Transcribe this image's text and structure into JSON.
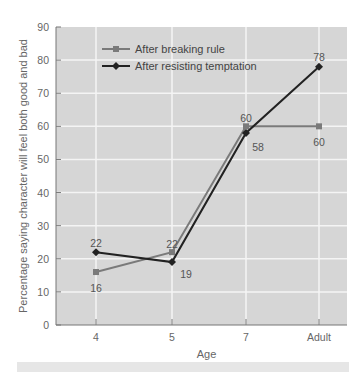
{
  "chart_data": {
    "type": "line",
    "title": "",
    "xlabel": "Age",
    "ylabel": "Percentage saying character will feel both good and bad",
    "categories": [
      "4",
      "5",
      "7",
      "Adult"
    ],
    "ylim": [
      0,
      90
    ],
    "yticks": [
      0,
      10,
      20,
      30,
      40,
      50,
      60,
      70,
      80,
      90
    ],
    "grid": true,
    "legend_position": "upper-left",
    "series": [
      {
        "name": "After breaking rule",
        "values": [
          16,
          22,
          60,
          60
        ],
        "color": "#7a7a7a",
        "marker": "square"
      },
      {
        "name": "After resisting temptation",
        "values": [
          22,
          19,
          58,
          78
        ],
        "color": "#222222",
        "marker": "diamond"
      }
    ],
    "data_labels": [
      {
        "series": 0,
        "index": 0,
        "text": "16"
      },
      {
        "series": 0,
        "index": 1,
        "text": "22"
      },
      {
        "series": 0,
        "index": 2,
        "text": "60"
      },
      {
        "series": 0,
        "index": 3,
        "text": "60"
      },
      {
        "series": 1,
        "index": 0,
        "text": "22"
      },
      {
        "series": 1,
        "index": 1,
        "text": "19"
      },
      {
        "series": 1,
        "index": 2,
        "text": "58"
      },
      {
        "series": 1,
        "index": 3,
        "text": "78"
      }
    ]
  },
  "style": {
    "plot_bg": "#d6d6d6",
    "grid_color": "#f4f4f4",
    "axis_color": "#777777"
  }
}
